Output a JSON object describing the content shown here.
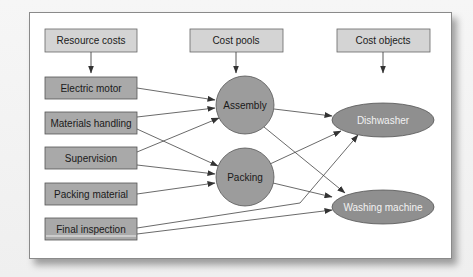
{
  "headers": {
    "resource_costs": "Resource costs",
    "cost_pools": "Cost pools",
    "cost_objects": "Cost objects"
  },
  "resources": [
    {
      "label": "Electric motor"
    },
    {
      "label": "Materials handling"
    },
    {
      "label": "Supervision"
    },
    {
      "label": "Packing material"
    },
    {
      "label": "Final inspection"
    }
  ],
  "cost_pools": [
    {
      "label": "Assembly"
    },
    {
      "label": "Packing"
    }
  ],
  "cost_objects": [
    {
      "label": "Dishwasher"
    },
    {
      "label": "Washing machine"
    }
  ],
  "connections": [
    {
      "from": "Electric motor",
      "to": "Assembly"
    },
    {
      "from": "Materials handling",
      "to": "Assembly"
    },
    {
      "from": "Materials handling",
      "to": "Packing"
    },
    {
      "from": "Supervision",
      "to": "Assembly"
    },
    {
      "from": "Supervision",
      "to": "Packing"
    },
    {
      "from": "Packing material",
      "to": "Packing"
    },
    {
      "from": "Final inspection",
      "to": "Dishwasher"
    },
    {
      "from": "Final inspection",
      "to": "Washing machine"
    },
    {
      "from": "Assembly",
      "to": "Dishwasher"
    },
    {
      "from": "Assembly",
      "to": "Washing machine"
    },
    {
      "from": "Packing",
      "to": "Dishwasher"
    },
    {
      "from": "Packing",
      "to": "Washing machine"
    }
  ],
  "colors": {
    "header_fill": "#d4d4d4",
    "resource_fill": "#a9a9a9",
    "node_fill": "#9c9c9c",
    "object_fill": "#8f8f8f",
    "stroke": "#555555",
    "text_dark": "#1a1a1a",
    "text_light": "#f2f2f2"
  }
}
